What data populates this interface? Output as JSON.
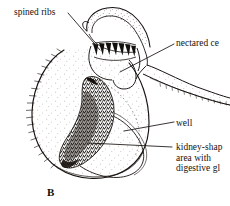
{
  "figure": {
    "panel_letter": "B",
    "ink_color": "#17120f",
    "background_color": "#ffffff",
    "stipple_color": "#241d18"
  },
  "labels": {
    "spined_ribs": "spined ribs",
    "nectared_cells": "nectared ce",
    "well": "well",
    "kidney_line1": "kidney-shap",
    "kidney_line2": "area with",
    "kidney_line3": "digestive gl"
  },
  "parts": {
    "hood": "hood",
    "spine_row": "spined-ribs-row",
    "pitcher_body": "pitcher-body",
    "well_cavity": "well-cavity",
    "digestive_area": "kidney-shaped-digestive-area",
    "tail": "nectar-tail-appendage",
    "marginal_hairs": "marginal-hairs"
  }
}
